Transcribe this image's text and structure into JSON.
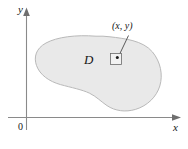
{
  "figure": {
    "background_color": "#ffffff",
    "axes": {
      "x_axis_label": "x",
      "y_axis_label": "y",
      "origin_label": "0",
      "axis_color": "#8a8a8a",
      "x_axis_y_px": 117,
      "y_axis_x_px": 26
    },
    "region": {
      "label": "D",
      "fill_color": "#e9e9e9",
      "stroke_color": "#b9b9b9",
      "description": "closed irregular blob-shaped region with a concave notch along its lower edge"
    },
    "annotation": {
      "point_label": "(x, y)",
      "marker_shape": "square-with-dot",
      "marker_center_px": [
        116,
        59
      ],
      "leader_line_from_px": [
        128,
        36
      ],
      "leader_line_to_px": [
        118,
        56
      ],
      "leader_color": "#4a4a4a"
    }
  }
}
